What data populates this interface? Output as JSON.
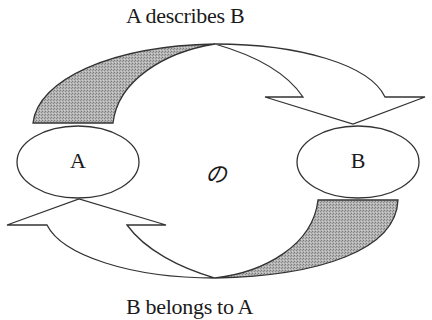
{
  "diagram": {
    "top_caption": "A describes B",
    "bottom_caption": "B belongs to A",
    "center_label": "の",
    "nodes": [
      {
        "id": "A",
        "label": "A"
      },
      {
        "id": "B",
        "label": "B"
      }
    ],
    "edges": [
      {
        "from": "A",
        "to": "B",
        "label": "A describes B",
        "position": "top"
      },
      {
        "from": "B",
        "to": "A",
        "label": "B belongs to A",
        "position": "bottom"
      }
    ],
    "colors": {
      "stroke": "#333333",
      "shaded_fill": "#a9a9a9",
      "background": "#ffffff"
    }
  }
}
